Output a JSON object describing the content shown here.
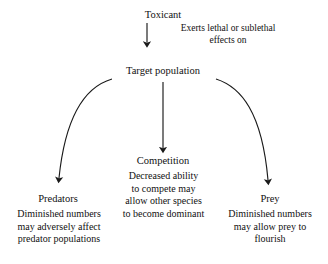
{
  "diagram": {
    "background_color": "#ffffff",
    "stroke_color": "#1a1a1a",
    "text_color": "#111111",
    "nodes": {
      "toxicant": "Toxicant",
      "exerts_label": "Exerts lethal or sublethal\neffects on",
      "target_population": "Target population",
      "competition_title": "Competition",
      "competition_body": "Decreased ability\nto compete may\nallow other species\nto become dominant",
      "predators_title": "Predators",
      "predators_body": "Diminished numbers\nmay adversely affect\npredator populations",
      "prey_title": "Prey",
      "prey_body": "Diminished numbers\nmay allow prey to\nflourish"
    },
    "edges": [
      {
        "name": "toxicant-to-target",
        "from": "toxicant",
        "to": "target_population",
        "style": "straight",
        "label": "Exerts lethal or sublethal effects on"
      },
      {
        "name": "target-to-predators",
        "from": "target_population",
        "to": "predators_title",
        "style": "curved-left",
        "label": ""
      },
      {
        "name": "target-to-competition",
        "from": "target_population",
        "to": "competition_title",
        "style": "straight",
        "label": ""
      },
      {
        "name": "target-to-prey",
        "from": "target_population",
        "to": "prey_title",
        "style": "curved-right",
        "label": ""
      }
    ]
  }
}
